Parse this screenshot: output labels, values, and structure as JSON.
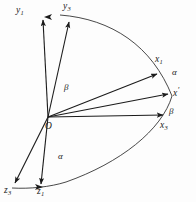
{
  "figure": {
    "kind": "vector-axes-diagram",
    "background_color": "#fdfdfd",
    "stroke_color": "#1b1b1b",
    "origin_label": "O",
    "labels": {
      "y1": "y",
      "y1_sub": "1",
      "y3": "y",
      "y3_sub": "3",
      "x1": "x",
      "x1_sub": "1",
      "x3": "x",
      "x3_sub": "3",
      "x_prime": "x",
      "x_prime_mark": "′",
      "z1": "z",
      "z1_sub": "1",
      "z3": "z",
      "z3_sub": "3",
      "alpha_upper": "α",
      "alpha_lower": "α",
      "beta_upper": "β",
      "beta_lower": "β"
    }
  }
}
